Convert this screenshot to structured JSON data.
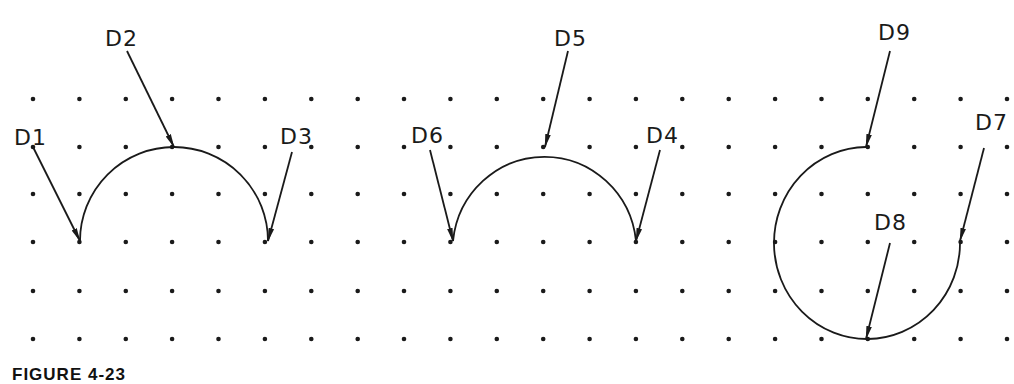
{
  "figure": {
    "caption": "FIGURE 4-23",
    "ink_color": "#1a1a1a",
    "background": "#ffffff"
  },
  "grid": {
    "x0": 33,
    "dx": 46.38,
    "cols": 22,
    "rows_y": [
      99,
      147,
      194,
      242,
      291,
      339
    ],
    "dot_radius": 2.3
  },
  "arcs": [
    {
      "name": "arc-three-point-1",
      "description": "Semicircle through D1, D2, D3",
      "path": "M 80 241 A 94 94 0 0 1 268 241"
    },
    {
      "name": "arc-three-point-2",
      "description": "Semicircle through D6, D5, D4",
      "path": "M 453 241 A 92 94 0 0 1 636 241"
    },
    {
      "name": "arc-three-quarter",
      "description": "270 degree arc through D9, D8, D7",
      "path": "M 866 147 A 93 96 0 1 0 960 242"
    }
  ],
  "points": [
    {
      "id": "D1",
      "label": "D1",
      "label_x": 14,
      "label_y": 145,
      "from": [
        33,
        147
      ],
      "to": [
        80,
        241
      ]
    },
    {
      "id": "D2",
      "label": "D2",
      "label_x": 105,
      "label_y": 46,
      "from": [
        127,
        51
      ],
      "to": [
        174,
        147
      ]
    },
    {
      "id": "D3",
      "label": "D3",
      "label_x": 280,
      "label_y": 144,
      "from": [
        292,
        152
      ],
      "to": [
        268,
        241
      ]
    },
    {
      "id": "D6",
      "label": "D6",
      "label_x": 411,
      "label_y": 143,
      "from": [
        430,
        150
      ],
      "to": [
        453,
        241
      ]
    },
    {
      "id": "D5",
      "label": "D5",
      "label_x": 554,
      "label_y": 46,
      "from": [
        568,
        51
      ],
      "to": [
        545,
        147
      ]
    },
    {
      "id": "D4",
      "label": "D4",
      "label_x": 646,
      "label_y": 143,
      "from": [
        660,
        150
      ],
      "to": [
        636,
        241
      ]
    },
    {
      "id": "D9",
      "label": "D9",
      "label_x": 878,
      "label_y": 40,
      "from": [
        890,
        51
      ],
      "to": [
        866,
        147
      ]
    },
    {
      "id": "D7",
      "label": "D7",
      "label_x": 975,
      "label_y": 130,
      "from": [
        984,
        148
      ],
      "to": [
        960,
        241
      ]
    },
    {
      "id": "D8",
      "label": "D8",
      "label_x": 874,
      "label_y": 230,
      "from": [
        890,
        243
      ],
      "to": [
        866,
        339
      ]
    }
  ]
}
